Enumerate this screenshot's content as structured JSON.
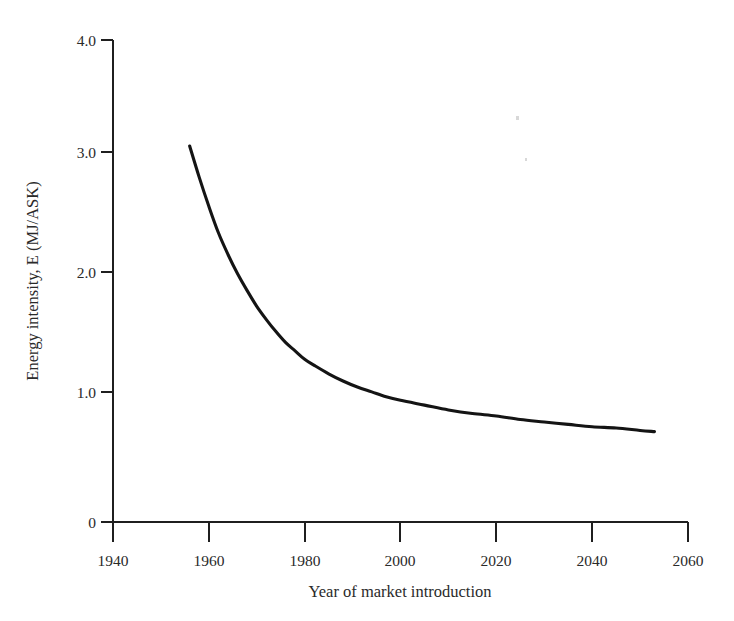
{
  "chart_data": {
    "type": "line",
    "title": "",
    "xlabel": "Year of market introduction",
    "ylabel": "Energy intensity, E (MJ/ASK)",
    "xlim": [
      1940,
      2060
    ],
    "ylim": [
      0,
      4.0
    ],
    "grid": false,
    "legend": null,
    "xticks": [
      1940,
      1960,
      1980,
      2000,
      2020,
      2040,
      2060
    ],
    "xtick_labels": [
      "1940",
      "1960",
      "1980",
      "2000",
      "2020",
      "2040",
      "2060"
    ],
    "yticks": [
      0,
      1.0,
      2.0,
      3.0,
      4.0
    ],
    "ytick_labels": [
      "0",
      "1.0",
      "2.0",
      "3.0",
      "4.0"
    ],
    "series": [
      {
        "name": "Energy intensity trend",
        "color": "#141414",
        "line_width": 3.1,
        "x": [
          1956,
          1958,
          1960,
          1962,
          1964,
          1966,
          1968,
          1970,
          1972,
          1974,
          1976,
          1978,
          1980,
          1982,
          1985,
          1988,
          1991,
          1994,
          1997,
          2000,
          2005,
          2010,
          2015,
          2020,
          2025,
          2030,
          2035,
          2040,
          2045,
          2050,
          2053
        ],
        "y": [
          3.12,
          2.86,
          2.62,
          2.4,
          2.22,
          2.06,
          1.92,
          1.79,
          1.68,
          1.58,
          1.49,
          1.42,
          1.35,
          1.3,
          1.23,
          1.17,
          1.12,
          1.08,
          1.04,
          1.01,
          0.97,
          0.93,
          0.9,
          0.88,
          0.85,
          0.83,
          0.81,
          0.79,
          0.78,
          0.76,
          0.75
        ]
      }
    ]
  },
  "axes": {
    "y_title": "Energy intensity, E (MJ/ASK)",
    "x_title": "Year of market introduction",
    "y_tick_labels": [
      "4.0",
      "3.0",
      "2.0",
      "1.0",
      "0"
    ],
    "x_tick_labels": [
      "1940",
      "1960",
      "1980",
      "2000",
      "2020",
      "2040",
      "2060"
    ]
  }
}
